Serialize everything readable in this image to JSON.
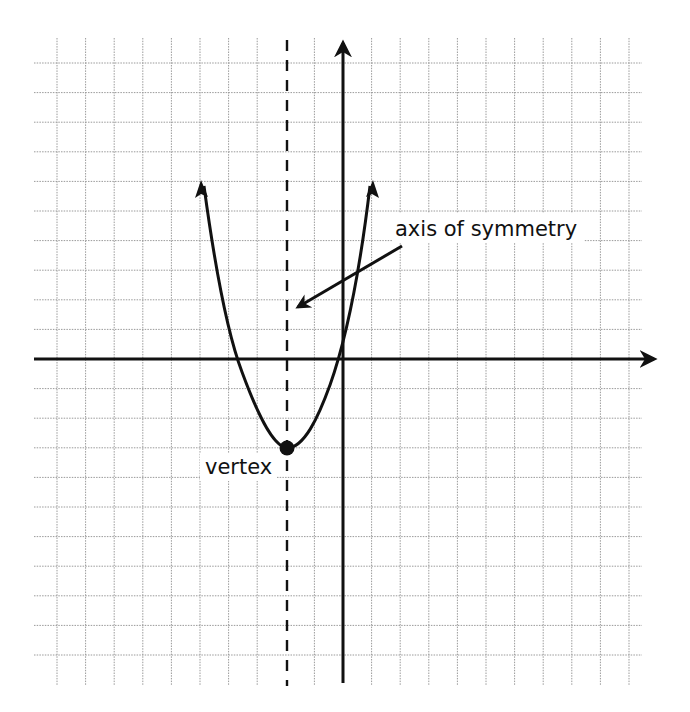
{
  "diagram": {
    "type": "coordinate-grid-diagram",
    "grid": {
      "x_min": -10,
      "x_max": 10,
      "y_min": -10,
      "y_max": 10,
      "origin_px": [
        343,
        359
      ],
      "step_px": [
        28.6,
        29.6
      ],
      "line_color": "#9a9a9a",
      "axis_color": "#111111"
    },
    "parabola": {
      "vertex": [
        -2,
        -3
      ],
      "opens": "up",
      "x_intercepts_approx": [
        -3.8,
        -0.2
      ],
      "arrow_ends": [
        [
          -5,
          6
        ],
        [
          1,
          6
        ]
      ],
      "color": "#111111"
    },
    "axis_of_symmetry": {
      "x": -2,
      "style": "dashed"
    },
    "labels": {
      "axis_of_symmetry": "axis of symmetry",
      "vertex": "vertex"
    },
    "annotation_arrow": {
      "from_px": [
        402,
        246
      ],
      "to_px": [
        294,
        310
      ],
      "points_to": "axis_of_symmetry"
    }
  }
}
